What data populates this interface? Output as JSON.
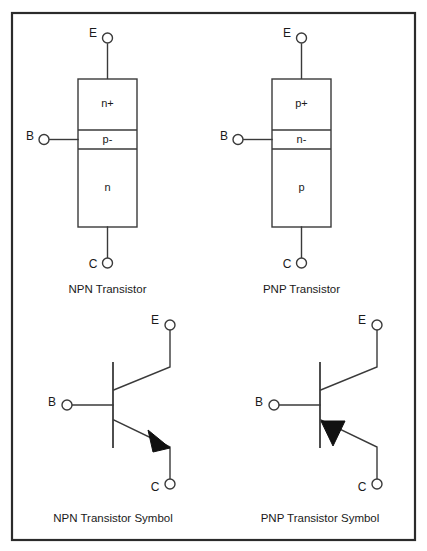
{
  "figure": {
    "background_color": "#ffffff",
    "line_color": "#3a3a3a",
    "frame_color": "#2b2b2b",
    "fill_color": "#111111"
  },
  "panels": [
    {
      "id": "npn-structure",
      "caption": "NPN Transistor",
      "kind": "structure",
      "terminals": [
        {
          "name": "E",
          "label": "E",
          "position": "top"
        },
        {
          "name": "B",
          "label": "B",
          "position": "left"
        },
        {
          "name": "C",
          "label": "C",
          "position": "bottom"
        }
      ],
      "regions": [
        {
          "label": "n+",
          "name": "emitter-region"
        },
        {
          "label": "p-",
          "name": "base-region"
        },
        {
          "label": "n",
          "name": "collector-region"
        }
      ]
    },
    {
      "id": "pnp-structure",
      "caption": "PNP Transistor",
      "kind": "structure",
      "terminals": [
        {
          "name": "E",
          "label": "E",
          "position": "top"
        },
        {
          "name": "B",
          "label": "B",
          "position": "left"
        },
        {
          "name": "C",
          "label": "C",
          "position": "bottom"
        }
      ],
      "regions": [
        {
          "label": "p+",
          "name": "emitter-region"
        },
        {
          "label": "n-",
          "name": "base-region"
        },
        {
          "label": "p",
          "name": "collector-region"
        }
      ]
    },
    {
      "id": "npn-symbol",
      "caption": "NPN Transistor Symbol",
      "kind": "symbol",
      "arrow_direction": "outward",
      "arrow_on_lead": "C",
      "terminals": [
        {
          "name": "E",
          "label": "E",
          "position": "top-right"
        },
        {
          "name": "B",
          "label": "B",
          "position": "left"
        },
        {
          "name": "C",
          "label": "C",
          "position": "bottom-right"
        }
      ]
    },
    {
      "id": "pnp-symbol",
      "caption": "PNP Transistor Symbol",
      "kind": "symbol",
      "arrow_direction": "inward",
      "arrow_on_lead": "C",
      "terminals": [
        {
          "name": "E",
          "label": "E",
          "position": "top-right"
        },
        {
          "name": "B",
          "label": "B",
          "position": "left"
        },
        {
          "name": "C",
          "label": "C",
          "position": "bottom-right"
        }
      ]
    }
  ],
  "captions": {
    "npn_structure": "NPN Transistor",
    "pnp_structure": "PNP Transistor",
    "npn_symbol": "NPN Transistor Symbol",
    "pnp_symbol": "PNP Transistor Symbol"
  },
  "labels": {
    "npn_emitter_region": "n+",
    "npn_base_region": "p-",
    "npn_collector_region": "n",
    "pnp_emitter_region": "p+",
    "pnp_base_region": "n-",
    "pnp_collector_region": "p",
    "terminal_e": "E",
    "terminal_b": "B",
    "terminal_c": "C"
  }
}
